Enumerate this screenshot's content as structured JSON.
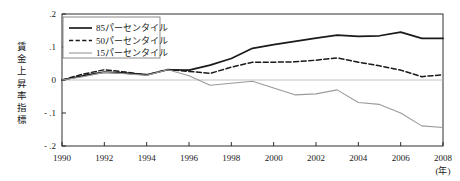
{
  "chart_data": {
    "type": "line",
    "title": "",
    "xlabel": "(年)",
    "ylabel": "賃金上昇率指標",
    "x": [
      1990,
      1991,
      1992,
      1993,
      1994,
      1995,
      1996,
      1997,
      1998,
      1999,
      2000,
      2001,
      2002,
      2003,
      2004,
      2005,
      2006,
      2007,
      2008
    ],
    "xlim": [
      1990,
      2008
    ],
    "ylim": [
      -0.2,
      0.2
    ],
    "xticks": [
      "1990",
      "1992",
      "1994",
      "1996",
      "1998",
      "2000",
      "2002",
      "2004",
      "2006",
      "2008"
    ],
    "xtick_values": [
      1990,
      1992,
      1994,
      1996,
      1998,
      2000,
      2002,
      2004,
      2006,
      2008
    ],
    "yticks": [
      ".2",
      ".1",
      "0",
      "- .1",
      "- .2"
    ],
    "ytick_values": [
      0.2,
      0.1,
      0,
      -0.1,
      -0.2
    ],
    "grid": false,
    "zero_line": true,
    "legend_position": "top-left",
    "series": [
      {
        "name": "85パーセンタイル",
        "style": "solid",
        "color": "#1a1a1a",
        "width": 1.7,
        "values": [
          0.0,
          0.013,
          0.024,
          0.021,
          0.016,
          0.031,
          0.03,
          0.045,
          0.065,
          0.096,
          0.107,
          0.117,
          0.127,
          0.136,
          0.132,
          0.134,
          0.145,
          0.126,
          0.126
        ]
      },
      {
        "name": "50パーセンタイル",
        "style": "dashed",
        "color": "#1a1a1a",
        "width": 1.5,
        "values": [
          0.0,
          0.018,
          0.031,
          0.024,
          0.015,
          0.032,
          0.026,
          0.02,
          0.039,
          0.054,
          0.054,
          0.055,
          0.06,
          0.067,
          0.054,
          0.043,
          0.03,
          0.01,
          0.016
        ]
      },
      {
        "name": "15パーセンタイル",
        "style": "solid-light",
        "color": "#9a9a9a",
        "width": 1.1,
        "values": [
          0.0,
          0.01,
          0.023,
          0.019,
          0.014,
          0.031,
          0.013,
          -0.016,
          -0.01,
          -0.004,
          -0.024,
          -0.045,
          -0.042,
          -0.03,
          -0.068,
          -0.074,
          -0.1,
          -0.139,
          -0.144
        ]
      }
    ]
  },
  "legend": {
    "items": [
      {
        "label": "85パーセンタイル"
      },
      {
        "label": "50パーセンタイル"
      },
      {
        "label": "15パーセンタイル"
      }
    ]
  }
}
